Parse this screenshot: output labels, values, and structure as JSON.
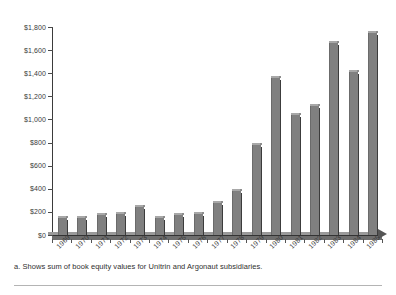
{
  "footnote": "a. Shows sum of book equity values for Unitrin and Argonaut subsidiaries.",
  "colors": {
    "bar_face": "#808080",
    "bar_shadow": "#3c3c3c",
    "bar_highlight": "#a8a8a8",
    "axis": "#3b3b3b",
    "text": "#3a3a3a",
    "background": "#ffffff"
  },
  "chart_data": {
    "type": "bar",
    "title": "",
    "subtitle": "",
    "xlabel": "",
    "ylabel": "",
    "ylim": [
      0,
      1800
    ],
    "grid": false,
    "legend": "none",
    "ytick_labels": [
      "$0",
      "$200",
      "$400",
      "$600",
      "$800",
      "$1,000",
      "$1,200",
      "$1,400",
      "$1,600",
      "$1,800"
    ],
    "ytick_values": [
      0,
      200,
      400,
      600,
      800,
      1000,
      1200,
      1400,
      1600,
      1800
    ],
    "categories": [
      "1969",
      "1970",
      "1971",
      "1972",
      "1973",
      "1974",
      "1975",
      "1976",
      "1977",
      "1978",
      "1979",
      "1980",
      "1981",
      "1982",
      "1983",
      "1984",
      "1985"
    ],
    "values": [
      145,
      150,
      175,
      185,
      240,
      150,
      170,
      185,
      280,
      385,
      780,
      1355,
      1035,
      1120,
      1660,
      1410,
      1750
    ],
    "series": [
      {
        "name": "Book equity value",
        "values": [
          145,
          150,
          175,
          185,
          240,
          150,
          170,
          185,
          280,
          385,
          780,
          1355,
          1035,
          1120,
          1660,
          1410,
          1750
        ]
      }
    ],
    "annotations": []
  }
}
